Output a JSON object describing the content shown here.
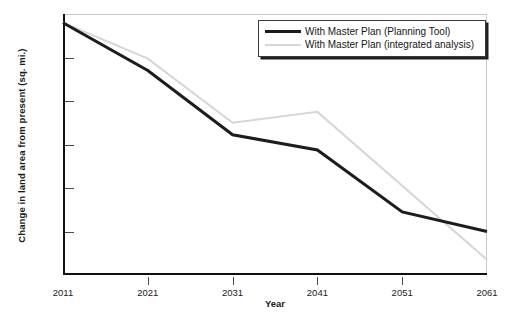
{
  "chart_data": {
    "type": "line",
    "title": "",
    "xlabel": "Year",
    "ylabel": "Change in land area from present (sq. mi.)",
    "x": [
      2011,
      2021,
      2031,
      2041,
      2051,
      2061
    ],
    "xticklabels": [
      "2011",
      "2021",
      "2031",
      "2041",
      "2051",
      "2061"
    ],
    "xlim": [
      2011,
      2061
    ],
    "ylim": [
      -1200,
      0
    ],
    "yticks": [
      0,
      -200,
      -400,
      -600,
      -800,
      -1000,
      -1200
    ],
    "yticklabels": [
      "0",
      "-200",
      "-400",
      "-600",
      "-800",
      "-1,000",
      "-1,200"
    ],
    "grid": false,
    "legend_position": "top-right",
    "series": [
      {
        "name": "With Master Plan (Planning Tool)",
        "color": "#1c1c1c",
        "width": 3,
        "values": [
          -40,
          -260,
          -555,
          -625,
          -910,
          -1000
        ]
      },
      {
        "name": "With Master Plan (integrated analysis)",
        "color": "#d6d6d6",
        "width": 2,
        "values": [
          -40,
          -205,
          -500,
          -450,
          -790,
          -1130
        ]
      }
    ]
  },
  "legend": {
    "items": [
      {
        "label": "With Master Plan (Planning Tool)",
        "swatch": "dark"
      },
      {
        "label": "With Master Plan (integrated analysis)",
        "swatch": "light"
      }
    ]
  }
}
